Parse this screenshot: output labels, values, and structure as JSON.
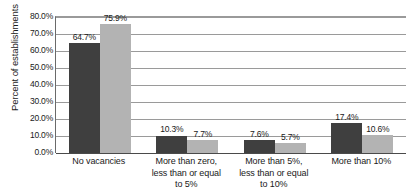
{
  "chart_data": {
    "type": "bar",
    "title": "",
    "xlabel": "",
    "ylabel": "Percent of establishments",
    "ylim": [
      0,
      80
    ],
    "grid": true,
    "legend": "none",
    "categories": [
      "No vacancies",
      "More than zero, less than or equal to 5%",
      "More than 5%, less than or equal to 10%",
      "More than 10%"
    ],
    "category_lines": [
      [
        "No vacancies"
      ],
      [
        "More than zero,",
        "less than or equal",
        "to 5%"
      ],
      [
        "More than 5%,",
        "less than or equal",
        "to 10%"
      ],
      [
        "More than 10%"
      ]
    ],
    "series": [
      {
        "name": "series-1",
        "color": "#3f3f3f",
        "values": [
          64.7,
          10.3,
          7.6,
          17.4
        ],
        "labels": [
          "64.7%",
          "10.3%",
          "7.6%",
          "17.4%"
        ]
      },
      {
        "name": "series-2",
        "color": "#b3b3b3",
        "values": [
          75.9,
          7.7,
          5.7,
          10.6
        ],
        "labels": [
          "75.9%",
          "7.7%",
          "5.7%",
          "10.6%"
        ]
      }
    ],
    "y_ticks": [
      {
        "value": 80,
        "label": "80.0%"
      },
      {
        "value": 70,
        "label": "70.0%"
      },
      {
        "value": 60,
        "label": "60.0%"
      },
      {
        "value": 50,
        "label": "50.0%"
      },
      {
        "value": 40,
        "label": "40.0%"
      },
      {
        "value": 30,
        "label": "30.0%"
      },
      {
        "value": 20,
        "label": "20.0%"
      },
      {
        "value": 10,
        "label": "10.0%"
      },
      {
        "value": 0,
        "label": "0.0%"
      }
    ],
    "colors": {
      "series_1": "#3f3f3f",
      "series_2": "#b3b3b3",
      "gridline": "#9a9a9a",
      "axis": "#4a4a4a",
      "text": "#1a1a1a",
      "background": "#ffffff"
    }
  }
}
